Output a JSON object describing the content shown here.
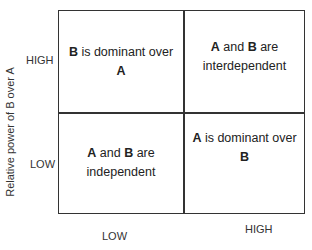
{
  "diagram": {
    "type": "2x2 matrix",
    "y_axis": {
      "label": "Relative power of B over A",
      "ticks": {
        "high": "HIGH",
        "low": "LOW"
      }
    },
    "x_axis": {
      "label": "",
      "ticks": {
        "low": "LOW",
        "high": "HIGH"
      }
    },
    "quadrants": {
      "top_left": {
        "parts": [
          {
            "b": "B"
          },
          {
            "t": " is dominant over "
          },
          {
            "b": "A"
          }
        ]
      },
      "top_right": {
        "parts": [
          {
            "b": "A"
          },
          {
            "t": " and "
          },
          {
            "b": "B"
          },
          {
            "t": " are interdependent"
          }
        ]
      },
      "bottom_left": {
        "parts": [
          {
            "b": "A"
          },
          {
            "t": " and "
          },
          {
            "b": "B"
          },
          {
            "t": " are independent"
          }
        ]
      },
      "bottom_right": {
        "parts": [
          {
            "b": "A"
          },
          {
            "t": " is dominant over "
          },
          {
            "b": "B"
          }
        ]
      }
    },
    "quadrant_text": {
      "top_left": {
        "a": "B",
        "b": " is dominant over ",
        "c": "A"
      },
      "top_right": {
        "a": "A",
        "b": " and ",
        "c": "B",
        "d": " are",
        "e": "interdependent"
      },
      "bottom_left": {
        "a": "A",
        "b": " and ",
        "c": "B",
        "d": " are",
        "e": "independent"
      },
      "bottom_right": {
        "a": "A",
        "b": " is dominant over ",
        "c": "B"
      }
    },
    "colors": {
      "line": "#333333",
      "text": "#222222",
      "background": "#ffffff"
    }
  }
}
